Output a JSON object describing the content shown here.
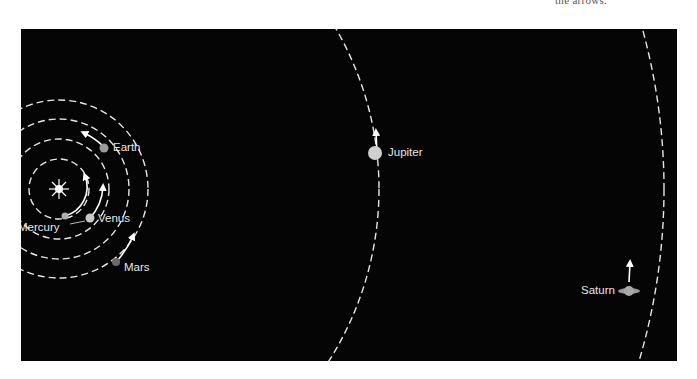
{
  "caption": "the arrows.",
  "diagram": {
    "background": "#050505",
    "orbit_color": "#e6e6e6",
    "sun": {
      "label": "",
      "color": "#ffffff"
    },
    "planets": [
      {
        "name": "Mercury",
        "color": "#b0b0b0"
      },
      {
        "name": "Venus",
        "color": "#c8c8c8"
      },
      {
        "name": "Earth",
        "color": "#9a9a9a"
      },
      {
        "name": "Mars",
        "color": "#6a6a6a"
      },
      {
        "name": "Jupiter",
        "color": "#cfcfcf"
      },
      {
        "name": "Saturn",
        "color": "#9a9a9a"
      }
    ]
  }
}
